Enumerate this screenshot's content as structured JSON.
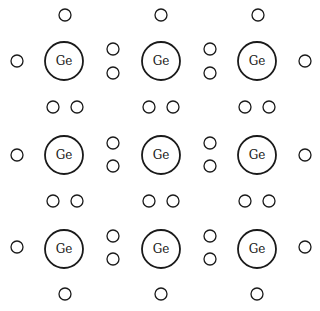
{
  "diagram": {
    "title": "",
    "atom_label": "Ge",
    "atom_radius": 19,
    "electron_radius": 6,
    "colors": {
      "stroke": "#1a1a1a",
      "fill": "#ffffff",
      "background": "#ffffff"
    },
    "atoms": [
      {
        "id": "ge-r1c1",
        "x": 64,
        "y": 61,
        "label": "Ge"
      },
      {
        "id": "ge-r1c2",
        "x": 161,
        "y": 61,
        "label": "Ge"
      },
      {
        "id": "ge-r1c3",
        "x": 257,
        "y": 61,
        "label": "Ge"
      },
      {
        "id": "ge-r2c1",
        "x": 64,
        "y": 155,
        "label": "Ge"
      },
      {
        "id": "ge-r2c2",
        "x": 161,
        "y": 155,
        "label": "Ge"
      },
      {
        "id": "ge-r2c3",
        "x": 257,
        "y": 155,
        "label": "Ge"
      },
      {
        "id": "ge-r3c1",
        "x": 64,
        "y": 249,
        "label": "Ge"
      },
      {
        "id": "ge-r3c2",
        "x": 161,
        "y": 249,
        "label": "Ge"
      },
      {
        "id": "ge-r3c3",
        "x": 257,
        "y": 249,
        "label": "Ge"
      }
    ],
    "electrons": [
      {
        "x": 65,
        "y": 15
      },
      {
        "x": 161,
        "y": 15
      },
      {
        "x": 258,
        "y": 15
      },
      {
        "x": 17,
        "y": 61
      },
      {
        "x": 113,
        "y": 49
      },
      {
        "x": 113,
        "y": 73
      },
      {
        "x": 210,
        "y": 49
      },
      {
        "x": 210,
        "y": 73
      },
      {
        "x": 305,
        "y": 61
      },
      {
        "x": 53,
        "y": 107
      },
      {
        "x": 77,
        "y": 107
      },
      {
        "x": 149,
        "y": 107
      },
      {
        "x": 173,
        "y": 107
      },
      {
        "x": 245,
        "y": 107
      },
      {
        "x": 269,
        "y": 107
      },
      {
        "x": 17,
        "y": 155
      },
      {
        "x": 113,
        "y": 143
      },
      {
        "x": 113,
        "y": 166
      },
      {
        "x": 210,
        "y": 143
      },
      {
        "x": 210,
        "y": 166
      },
      {
        "x": 305,
        "y": 155
      },
      {
        "x": 53,
        "y": 201
      },
      {
        "x": 77,
        "y": 201
      },
      {
        "x": 149,
        "y": 201
      },
      {
        "x": 173,
        "y": 201
      },
      {
        "x": 245,
        "y": 201
      },
      {
        "x": 269,
        "y": 201
      },
      {
        "x": 17,
        "y": 247
      },
      {
        "x": 113,
        "y": 236
      },
      {
        "x": 113,
        "y": 259
      },
      {
        "x": 210,
        "y": 236
      },
      {
        "x": 210,
        "y": 259
      },
      {
        "x": 305,
        "y": 247
      },
      {
        "x": 65,
        "y": 294
      },
      {
        "x": 161,
        "y": 294
      },
      {
        "x": 257,
        "y": 294
      }
    ]
  }
}
